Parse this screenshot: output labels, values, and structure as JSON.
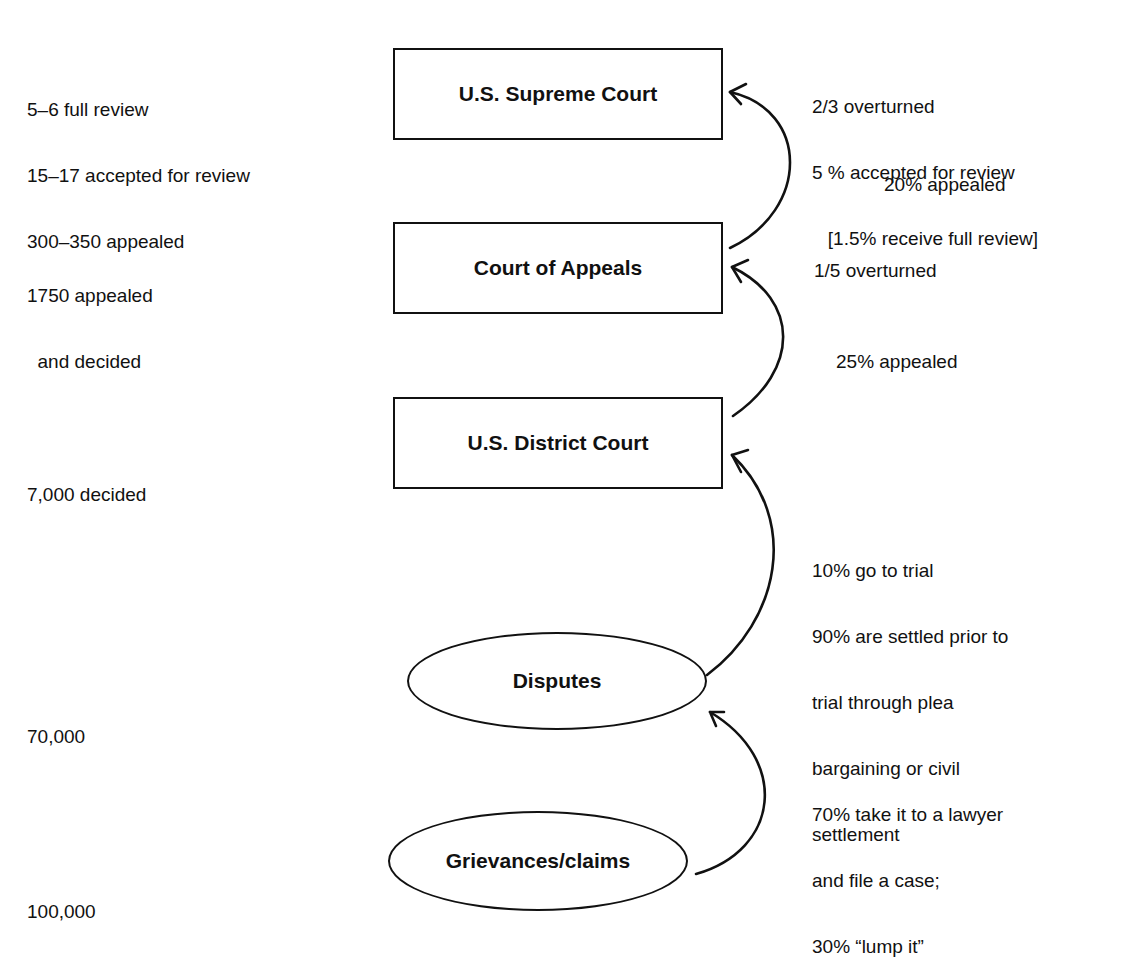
{
  "nodes": {
    "supreme": {
      "label": "U.S. Supreme Court",
      "shape": "rectangle"
    },
    "appeals": {
      "label": "Court of Appeals",
      "shape": "rectangle"
    },
    "district": {
      "label": "U.S. District Court",
      "shape": "rectangle"
    },
    "disputes": {
      "label": "Disputes",
      "shape": "ellipse"
    },
    "grievances": {
      "label": "Grievances/claims",
      "shape": "ellipse"
    }
  },
  "left_counts": {
    "supreme": [
      "5–6 full review",
      "15–17 accepted for review",
      "300–350 appealed"
    ],
    "appeals": [
      "1750 appealed",
      "  and decided"
    ],
    "district": [
      "7,000 decided"
    ],
    "disputes": [
      "70,000"
    ],
    "grievances": [
      "100,000"
    ]
  },
  "right_notes": {
    "supreme": [
      "2/3 overturned",
      "5 % accepted for review",
      "   [1.5% receive full review]"
    ],
    "appeals_to_supreme": "20% appealed",
    "appeals": "1/5 overturned",
    "district_to_appeals": "25% appealed",
    "disputes_to_district": [
      "10% go to trial",
      "90% are settled prior to",
      "trial through plea",
      "bargaining or civil",
      "settlement"
    ],
    "grievances_to_disputes": [
      "70% take it to a lawyer",
      "and file a case;",
      "30% “lump it”"
    ]
  },
  "edges": [
    {
      "from": "Grievances/claims",
      "to": "Disputes"
    },
    {
      "from": "Disputes",
      "to": "U.S. District Court"
    },
    {
      "from": "U.S. District Court",
      "to": "Court of Appeals"
    },
    {
      "from": "Court of Appeals",
      "to": "U.S. Supreme Court"
    }
  ]
}
